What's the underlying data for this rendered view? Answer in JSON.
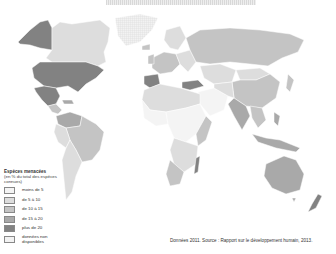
{
  "map": {
    "title": "Espèces menacées",
    "projection": "world",
    "colors": {
      "lt5": "#f4f4f4",
      "5to10": "#dddddd",
      "10to15": "#c4c4c4",
      "15to20": "#a9a9a9",
      "gt20": "#828282",
      "nodata": "#ececec",
      "border": "#ffffff",
      "ocean": "#ffffff"
    }
  },
  "legend": {
    "title": "Espèces menacées",
    "subtitle": "(en % du total des espèces connues)",
    "items": [
      {
        "label": "moins de 5",
        "color": "#f4f4f4"
      },
      {
        "label": "de 5 à 10",
        "color": "#dddddd"
      },
      {
        "label": "de 10 à 15",
        "color": "#c4c4c4"
      },
      {
        "label": "de 15 à 20",
        "color": "#a9a9a9"
      },
      {
        "label": "plus de 20",
        "color": "#828282"
      },
      {
        "label": "données non disponibles",
        "color": "#ececec",
        "hatched": true
      }
    ]
  },
  "source": "Données 2011. Source : Rapport sur le développement humain, 2013."
}
